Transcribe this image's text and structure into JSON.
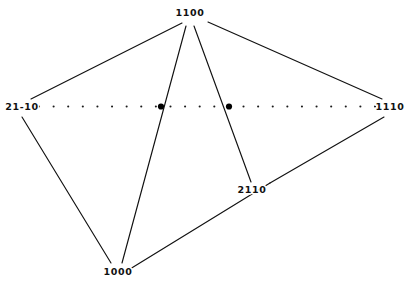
{
  "diagram": {
    "type": "graph-diagram",
    "background_color": "#ffffff",
    "line_color": "#111111",
    "node_color": "#000000",
    "width": 410,
    "height": 282,
    "labels": {
      "top": "1100",
      "left": "21-10",
      "right": "1110",
      "middle_right": "2110",
      "bottom": "1000"
    },
    "vertices": [
      {
        "id": "top",
        "label": "1100",
        "x": 190,
        "y": 13,
        "label_dx": 0,
        "label_dy": 0
      },
      {
        "id": "left",
        "label": "21-10",
        "x": 22,
        "y": 107,
        "label_dx": 0,
        "label_dy": 0
      },
      {
        "id": "right",
        "label": "1110",
        "x": 390,
        "y": 107,
        "label_dx": 0,
        "label_dy": 0
      },
      {
        "id": "middle_right",
        "label": "2110",
        "x": 252,
        "y": 190,
        "label_dx": 0,
        "label_dy": 0
      },
      {
        "id": "bottom",
        "label": "1000",
        "x": 118,
        "y": 272,
        "label_dx": 0,
        "label_dy": 0
      }
    ],
    "junction_nodes": [
      {
        "id": "junction-left",
        "x": 161,
        "y": 106.5,
        "radius": 3.1
      },
      {
        "id": "junction-right",
        "x": 229,
        "y": 106.5,
        "radius": 3.1
      }
    ],
    "dotted_axis": {
      "y": 106.5,
      "x_start": 39,
      "x_end": 375,
      "dot_count": 24,
      "dot_radius": 1.05
    },
    "edges": [
      {
        "id": "edge-top-left",
        "from": "1100",
        "to": "21-10",
        "x1": 182,
        "y1": 23,
        "x2": 31,
        "y2": 99
      },
      {
        "id": "edge-top-right",
        "from": "1100",
        "to": "1110",
        "x1": 208,
        "y1": 22,
        "x2": 382,
        "y2": 99
      },
      {
        "id": "edge-top-junction-left",
        "from": "1100",
        "to": "1000",
        "x1": 186,
        "y1": 26,
        "x2": 122,
        "y2": 263
      },
      {
        "id": "edge-top-junction-right",
        "from": "1100",
        "to": "2110",
        "x1": 194,
        "y1": 26,
        "x2": 251,
        "y2": 182
      },
      {
        "id": "edge-left-bottom",
        "from": "21-10",
        "to": "1000",
        "x1": 22,
        "y1": 117,
        "x2": 111,
        "y2": 263
      },
      {
        "id": "edge-bottom-middle",
        "from": "1000",
        "to": "2110",
        "x1": 130,
        "y1": 269,
        "x2": 270,
        "y2": 183
      },
      {
        "id": "edge-middle-right",
        "from": "2110",
        "to": "1110",
        "x1": 270,
        "y1": 183,
        "x2": 384,
        "y2": 117
      }
    ]
  }
}
